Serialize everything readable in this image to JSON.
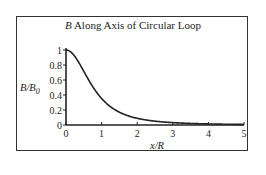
{
  "chart_data": {
    "type": "line",
    "title": "B Along Axis of Circular Loop",
    "title_italic_prefix": "B",
    "title_rest": " Along Axis of Circular Loop",
    "xlabel": "x/R",
    "ylabel": "B/B0",
    "xlim": [
      0,
      5
    ],
    "ylim": [
      0,
      1
    ],
    "x_ticks": [
      "0",
      "1",
      "2",
      "3",
      "4",
      "5"
    ],
    "y_ticks": [
      "0",
      "0.2",
      "0.4",
      "0.6",
      "0.8",
      "1"
    ],
    "grid": false,
    "legend": null,
    "series": [
      {
        "name": "B/B0 = 1/(1+(x/R)^2)^(3/2)",
        "x": [
          0,
          0.25,
          0.5,
          0.75,
          1.0,
          1.25,
          1.5,
          1.75,
          2.0,
          2.5,
          3.0,
          3.5,
          4.0,
          4.5,
          5.0
        ],
        "values": [
          1.0,
          0.913,
          0.716,
          0.512,
          0.354,
          0.244,
          0.171,
          0.122,
          0.089,
          0.051,
          0.032,
          0.021,
          0.014,
          0.01,
          0.007
        ]
      }
    ]
  }
}
